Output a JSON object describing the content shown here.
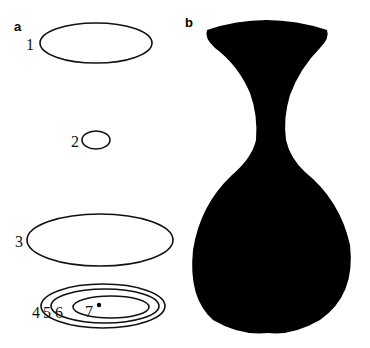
{
  "panels": {
    "a": {
      "label": "a",
      "contours": [
        {
          "id": "1",
          "label": "1"
        },
        {
          "id": "2",
          "label": "2"
        },
        {
          "id": "3",
          "label": "3"
        },
        {
          "id": "4",
          "label": "4"
        },
        {
          "id": "5",
          "label": "5"
        },
        {
          "id": "6",
          "label": "6"
        },
        {
          "id": "7",
          "label": "7"
        }
      ]
    },
    "b": {
      "label": "b",
      "shape": "vase-silhouette",
      "fill_color": "#000000"
    }
  }
}
